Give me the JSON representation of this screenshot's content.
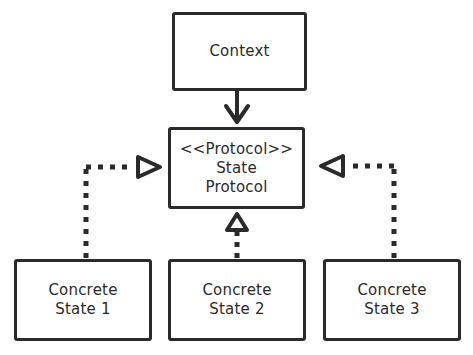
{
  "diagram": {
    "type": "state-pattern-class-diagram",
    "context": {
      "label": "Context"
    },
    "protocol": {
      "stereotype": "<<Protocol>>",
      "line1": "State",
      "line2": "Protocol"
    },
    "states": [
      {
        "line1": "Concrete",
        "line2": "State 1"
      },
      {
        "line1": "Concrete",
        "line2": "State 2"
      },
      {
        "line1": "Concrete",
        "line2": "State 3"
      }
    ],
    "edges": [
      {
        "from": "Context",
        "to": "State Protocol",
        "style": "solid",
        "head": "filled-arrow"
      },
      {
        "from": "Concrete State 1",
        "to": "State Protocol",
        "style": "dotted",
        "head": "hollow-triangle"
      },
      {
        "from": "Concrete State 2",
        "to": "State Protocol",
        "style": "dotted",
        "head": "hollow-triangle"
      },
      {
        "from": "Concrete State 3",
        "to": "State Protocol",
        "style": "dotted",
        "head": "hollow-triangle"
      }
    ],
    "colors": {
      "stroke": "#2a2a2a",
      "background": "#ffffff"
    }
  }
}
